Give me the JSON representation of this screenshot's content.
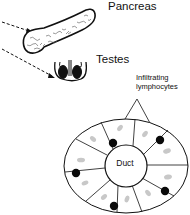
{
  "labels": {
    "pancreas": "Pancreas",
    "testes": "Testes",
    "infiltrating_line1": "Infiltrating",
    "infiltrating_line2": "lymphocytes",
    "duct": "Duct"
  },
  "colors": {
    "line": "#111111",
    "lymphocyte": "#0a0a0a",
    "nucleus": "#c8c8c8",
    "background": "#ffffff"
  },
  "diagram": {
    "organs": [
      "pancreas",
      "testes"
    ],
    "cross_section": {
      "center_label": "Duct",
      "lymphocyte_count": 5,
      "segments": 10
    }
  }
}
